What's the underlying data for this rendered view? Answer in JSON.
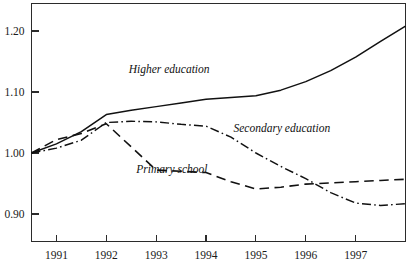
{
  "chart_data": {
    "type": "line",
    "title": "",
    "subtitle": "",
    "xlabel": "",
    "ylabel": "",
    "grid": false,
    "legend_position": "inline-annotations",
    "x": [
      1990.5,
      1991,
      1991.5,
      1992,
      1992.5,
      1993,
      1993.5,
      1994,
      1994.5,
      1995,
      1995.5,
      1996,
      1996.5,
      1997,
      1997.5,
      1998
    ],
    "xlim": [
      1990.5,
      1998
    ],
    "ylim": [
      0.855,
      1.245
    ],
    "xticks": [
      1991,
      1992,
      1993,
      1994,
      1995,
      1996,
      1997
    ],
    "xtick_labels": [
      "1991",
      "1992",
      "1993",
      "1994",
      "1995",
      "1996",
      "1997"
    ],
    "yticks": [
      0.9,
      1.0,
      1.1,
      1.2
    ],
    "ytick_labels": [
      "0.90",
      "1.10",
      "1.00",
      "1.20"
    ],
    "ytick_labels_ordered": [
      "1.20",
      "1.10",
      "1.00",
      "0.90"
    ],
    "series": [
      {
        "name": "Higher education",
        "style": "solid",
        "label_x": 1992.45,
        "label_y": 1.131,
        "values": [
          1.0,
          1.015,
          1.035,
          1.063,
          1.07,
          1.076,
          1.082,
          1.088,
          1.091,
          1.094,
          1.103,
          1.117,
          1.135,
          1.157,
          1.183,
          1.208
        ]
      },
      {
        "name": "Secondary education",
        "style": "dashdot",
        "label_x": 1994.55,
        "label_y": 1.035,
        "values": [
          1.0,
          1.008,
          1.021,
          1.05,
          1.052,
          1.051,
          1.047,
          1.044,
          1.026,
          1.0,
          0.978,
          0.958,
          0.935,
          0.918,
          0.914,
          0.917
        ]
      },
      {
        "name": "Primary school",
        "style": "dashed",
        "label_x": 1992.6,
        "label_y": 0.968,
        "values": [
          1.0,
          1.022,
          1.032,
          1.048,
          1.01,
          0.972,
          0.97,
          0.968,
          0.953,
          0.941,
          0.944,
          0.949,
          0.951,
          0.953,
          0.955,
          0.957
        ]
      }
    ],
    "colors": {
      "line": "#111111",
      "axis": "#2b2b2b",
      "background": "#ffffff"
    }
  }
}
